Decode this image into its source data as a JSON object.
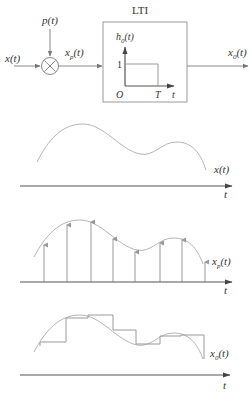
{
  "block_diagram": {
    "input_label": "x(t)",
    "impulse_train_label": "p(t)",
    "multiplier_symbol": "×",
    "sampled_label": "x",
    "sampled_sub": "p",
    "sampled_arg": "(t)",
    "system_title": "LTI",
    "impulse_response": {
      "label": "h",
      "label_sub": "0",
      "label_arg": "(t)",
      "amplitude_label": "1",
      "origin_label": "O",
      "width_label": "T",
      "axis_label": "t"
    },
    "output_label": "x",
    "output_sub": "0",
    "output_arg": "(t)"
  },
  "plots": [
    {
      "name": "original",
      "curve_label": "x(t)",
      "axis_label": "t"
    },
    {
      "name": "sampled",
      "curve_label_main": "x",
      "curve_label_sub": "p",
      "curve_label_arg": "(t)",
      "axis_label": "t"
    },
    {
      "name": "zero-order-hold",
      "curve_label_main": "x",
      "curve_label_sub": "0",
      "curve_label_arg": "(t)",
      "axis_label": "t"
    }
  ],
  "colors": {
    "curve": "#b5b5b5",
    "axis": "#555555",
    "stem": "#999999",
    "text": "#333333"
  }
}
